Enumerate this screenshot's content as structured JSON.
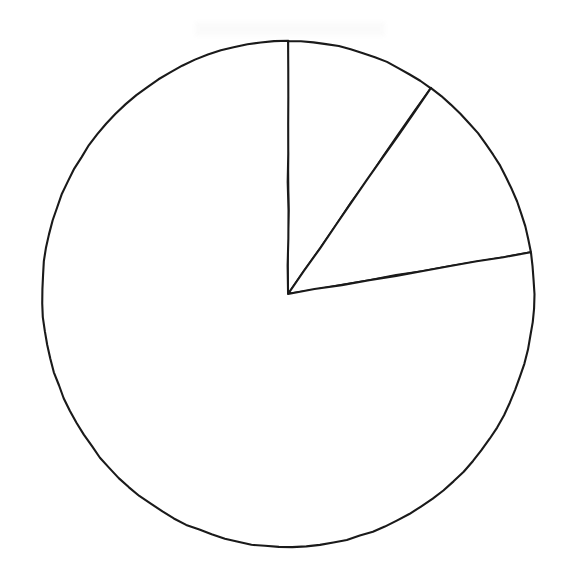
{
  "figure": {
    "kind": "pie-chart-diagram",
    "background_color": "#ffffff",
    "stroke_color": "#1a1a1a",
    "fill_color": "#ffffff",
    "stroke_width_px": 2.1,
    "caption": "",
    "title": ""
  },
  "geometry": {
    "center_x": 288,
    "center_y": 294,
    "radius_x": 246,
    "radius_y": 253,
    "start_angle_deg": 0,
    "rotation_note": "angles measured clockwise from 12 o'clock"
  },
  "chart_data": {
    "type": "pie",
    "title": "",
    "xlabel": "",
    "ylabel": "",
    "legend_position": "none",
    "grid": false,
    "labels": [
      "Slice 1",
      "Slice 2",
      "Slice 3"
    ],
    "values": [
      9.9,
      12.5,
      77.6
    ],
    "units": "percent",
    "start_angle_deg": 90,
    "direction": "clockwise",
    "slice_boundaries_deg": [
      0,
      35.5,
      80.5,
      360
    ],
    "slices": [
      {
        "label": "Slice 1",
        "value": 9.9,
        "angle_span_deg": 35.5,
        "start_deg": 0,
        "end_deg": 35.5,
        "fill": "#ffffff",
        "stroke": "#1a1a1a"
      },
      {
        "label": "Slice 2",
        "value": 12.5,
        "angle_span_deg": 45.0,
        "start_deg": 35.5,
        "end_deg": 80.5,
        "fill": "#ffffff",
        "stroke": "#1a1a1a"
      },
      {
        "label": "Slice 3",
        "value": 77.6,
        "angle_span_deg": 279.5,
        "start_deg": 80.5,
        "end_deg": 360,
        "fill": "#ffffff",
        "stroke": "#1a1a1a"
      }
    ],
    "annotations": []
  }
}
